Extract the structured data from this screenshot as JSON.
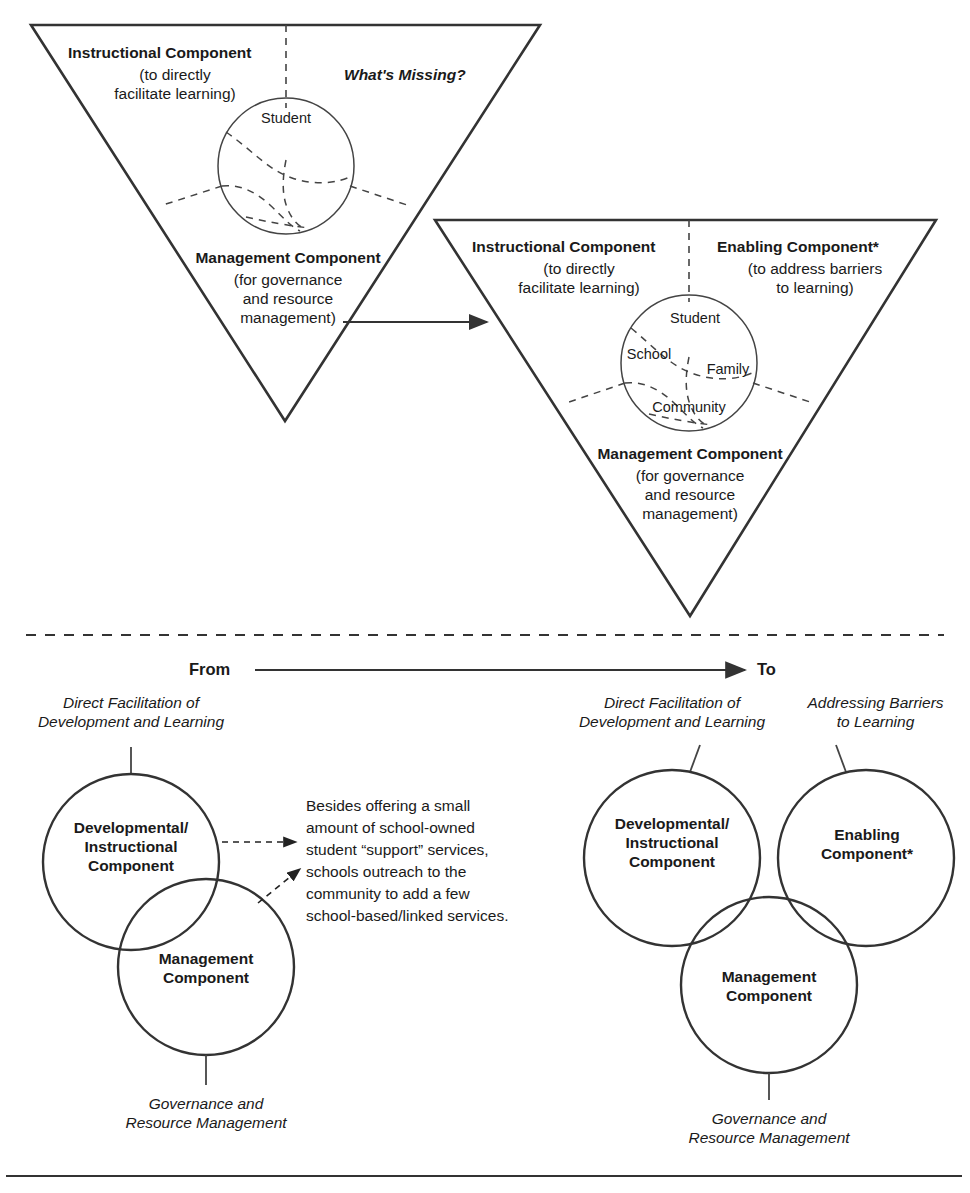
{
  "diagram": {
    "title_note": "Moving from a two-component to a three-component school model",
    "top_panel": {
      "triangle_from": {
        "instructional_heading": "Instructional Component",
        "instructional_sub": "(to directly\nfacilitate learning)",
        "whats_missing": "What's Missing?",
        "management_heading": "Management Component",
        "management_sub": "(for governance\nand resource\nmanagement)",
        "sphere_labels": [
          "Student"
        ]
      },
      "triangle_to": {
        "instructional_heading": "Instructional Component",
        "instructional_sub": "(to directly\nfacilitate learning)",
        "enabling_heading": "Enabling Component*",
        "enabling_sub": "(to address barriers\nto learning)",
        "management_heading": "Management Component",
        "management_sub": "(for governance\nand resource\nmanagement)",
        "sphere_labels": [
          "Student",
          "School",
          "Family",
          "Community"
        ]
      }
    },
    "transition": {
      "from_label": "From",
      "to_label": "To"
    },
    "bottom_panel": {
      "left": {
        "top_caption": "Direct Facilitation of\nDevelopment and Learning",
        "circle_1": "Developmental/\nInstructional\nComponent",
        "circle_2": "Management\nComponent",
        "bottom_caption": "Governance and\nResource Management"
      },
      "center_note": "Besides offering a small\namount of school-owned\nstudent “support” services,\nschools outreach to the\ncommunity to add a few\nschool-based/linked services.",
      "right": {
        "top_caption_left": "Direct Facilitation of\nDevelopment and Learning",
        "top_caption_right": "Addressing Barriers\nto Learning",
        "circle_1": "Developmental/\nInstructional\nComponent",
        "circle_2": "Enabling\nComponent*",
        "circle_3": "Management\nComponent",
        "bottom_caption": "Governance and\nResource Management"
      }
    },
    "colors": {
      "stroke": "#333333",
      "thin_stroke": "#444444",
      "text": "#1a1a1a",
      "background": "#ffffff"
    }
  }
}
